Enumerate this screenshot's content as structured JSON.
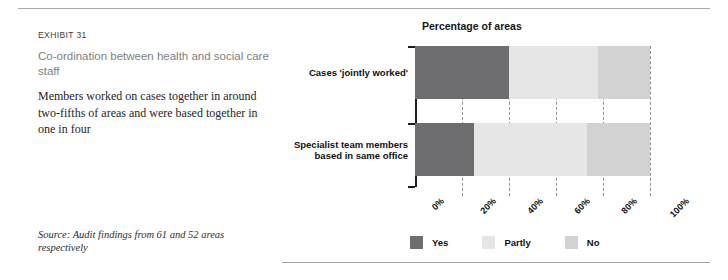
{
  "exhibit": {
    "label": "EXHIBIT 31",
    "title": "Co-ordination between health and social care staff",
    "description": "Members worked on cases together in around two-fifths of areas and were based together in one in four",
    "source": "Source: Audit findings from 61 and 52 areas respectively"
  },
  "chart_data": {
    "type": "bar",
    "orientation": "horizontal",
    "stacked": true,
    "normalized": true,
    "title": "Percentage of areas",
    "xlabel": "",
    "ylabel": "",
    "xlim": [
      0,
      100
    ],
    "xticks": [
      0,
      20,
      40,
      60,
      80,
      100
    ],
    "xtick_labels": [
      "0%",
      "20%",
      "40%",
      "60%",
      "80%",
      "100%"
    ],
    "xtick_rotation": -45,
    "grid": "vertical-dashed",
    "legend_position": "bottom-left",
    "categories": [
      "Cases 'jointly worked'",
      "Specialist team members based in same office"
    ],
    "category_lines": [
      [
        "Cases 'jointly worked'"
      ],
      [
        "Specialist team members",
        "based in same office"
      ]
    ],
    "series": [
      {
        "name": "Yes",
        "values": [
          40,
          25
        ],
        "color": "#6e6e70"
      },
      {
        "name": "Partly",
        "values": [
          38,
          48
        ],
        "color": "#e6e6e6"
      },
      {
        "name": "No",
        "values": [
          22,
          27
        ],
        "color": "#d2d2d2"
      }
    ]
  },
  "colors": {
    "rule": "#a8a8ac",
    "axis": "#1d1d20",
    "gridline": "#8e8e93",
    "title_text": "#7c7f84",
    "body_text": "#25252a"
  }
}
